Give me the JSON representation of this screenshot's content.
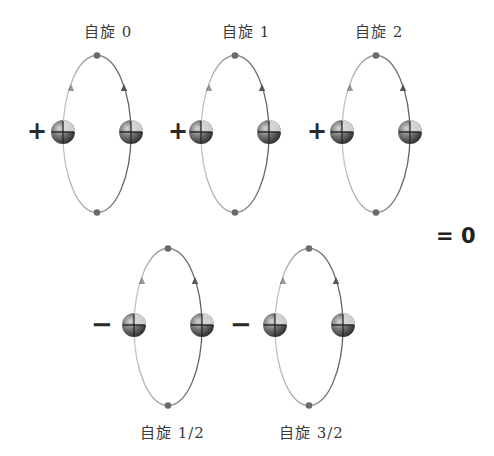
{
  "diagram": {
    "colors": {
      "orbit_light": "#b8b8b8",
      "orbit_dark": "#6a6a6a",
      "particle_dark": "#3c3c3c",
      "particle_mid": "#7a7a7a",
      "particle_highlight": "#d8d8d8",
      "text": "#3a3a3a"
    },
    "top_row": [
      {
        "label": "自旋 0",
        "sign": "+"
      },
      {
        "label": "自旋 1",
        "sign": "+"
      },
      {
        "label": "自旋 2",
        "sign": "+"
      }
    ],
    "bottom_row": [
      {
        "label": "自旋 1/2",
        "sign": "−"
      },
      {
        "label": "自旋 3/2",
        "sign": "−"
      }
    ],
    "result": "= 0"
  }
}
